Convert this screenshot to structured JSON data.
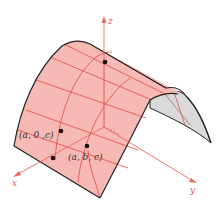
{
  "figure": {
    "type": "parabolic-cylinder-surface",
    "colors": {
      "surface_fill": "#f7b9b4",
      "surface_back": "#d9d9d9",
      "grid": "#e04a45",
      "axis": "#e9685f",
      "edge": "#222222",
      "point": "#1a0a0a",
      "label": "#333333"
    },
    "axes": {
      "x_label": "x",
      "y_label": "y",
      "z_label": "z"
    },
    "points": [
      {
        "id": "p-z-axis",
        "label": ""
      },
      {
        "id": "p-a0c",
        "label": "(a, 0 ,c)"
      },
      {
        "id": "p-abc",
        "label": "(a, b, c)"
      },
      {
        "id": "p-bottom",
        "label": ""
      }
    ]
  }
}
